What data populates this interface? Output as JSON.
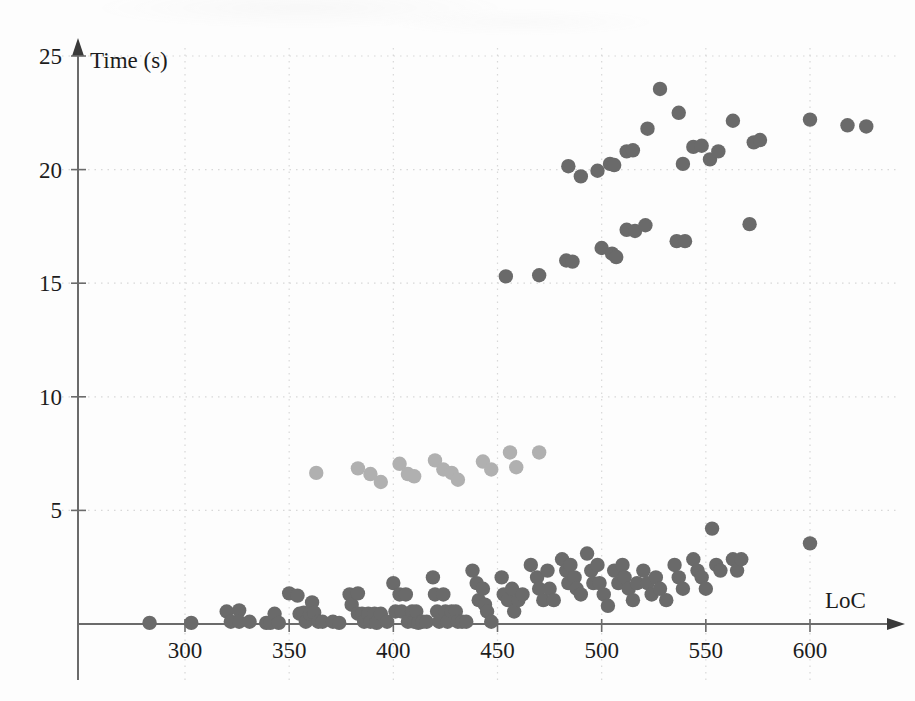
{
  "figure": {
    "background": "#fdfdfd",
    "ink": "#1c1c1c"
  },
  "axes": {
    "x_title": "LoC",
    "y_title": "Time (s)",
    "x_ticks": [
      "300",
      "350",
      "400",
      "450",
      "500",
      "550",
      "600"
    ],
    "y_ticks": [
      "5",
      "10",
      "15",
      "20",
      "25"
    ]
  },
  "chart_data": {
    "type": "scatter",
    "title": "",
    "xlabel": "LoC",
    "ylabel": "Time (s)",
    "xlim": [
      260,
      640
    ],
    "ylim": [
      0,
      25
    ],
    "xticks": [
      300,
      350,
      400,
      450,
      500,
      550,
      600
    ],
    "yticks": [
      5,
      10,
      15,
      20,
      25
    ],
    "grid": true,
    "grid_style": "dotted",
    "legend": null,
    "marker": "circle",
    "series": [
      {
        "name": "low-band",
        "color": "#6a6a6a",
        "points": [
          [
            283,
            0.05
          ],
          [
            303,
            0.05
          ],
          [
            320,
            0.55
          ],
          [
            322,
            0.1
          ],
          [
            326,
            0.6
          ],
          [
            326,
            0.1
          ],
          [
            331,
            0.1
          ],
          [
            339,
            0.05
          ],
          [
            341,
            0.05
          ],
          [
            343,
            0.45
          ],
          [
            345,
            0.05
          ],
          [
            350,
            1.35
          ],
          [
            354,
            1.25
          ],
          [
            355,
            0.45
          ],
          [
            357,
            0.5
          ],
          [
            358,
            0.1
          ],
          [
            360,
            0.45
          ],
          [
            361,
            0.95
          ],
          [
            362,
            0.5
          ],
          [
            364,
            0.1
          ],
          [
            366,
            0.1
          ],
          [
            371,
            0.1
          ],
          [
            374,
            0.05
          ],
          [
            379,
            1.3
          ],
          [
            380,
            0.85
          ],
          [
            383,
            1.35
          ],
          [
            383,
            0.45
          ],
          [
            385,
            0.45
          ],
          [
            386,
            0.1
          ],
          [
            388,
            0.45
          ],
          [
            389,
            0.1
          ],
          [
            391,
            0.45
          ],
          [
            392,
            0.05
          ],
          [
            394,
            0.45
          ],
          [
            397,
            0.1
          ],
          [
            400,
            1.8
          ],
          [
            401,
            0.55
          ],
          [
            403,
            1.3
          ],
          [
            404,
            0.55
          ],
          [
            406,
            1.3
          ],
          [
            407,
            0.1
          ],
          [
            409,
            0.55
          ],
          [
            410,
            0.1
          ],
          [
            411,
            0.55
          ],
          [
            412,
            0.05
          ],
          [
            414,
            0.1
          ],
          [
            416,
            0.1
          ],
          [
            419,
            2.05
          ],
          [
            420,
            1.3
          ],
          [
            421,
            0.55
          ],
          [
            422,
            0.1
          ],
          [
            424,
            1.3
          ],
          [
            425,
            0.55
          ],
          [
            426,
            0.1
          ],
          [
            428,
            0.55
          ],
          [
            430,
            0.55
          ],
          [
            431,
            0.1
          ],
          [
            433,
            0.1
          ],
          [
            435,
            0.1
          ],
          [
            438,
            2.35
          ],
          [
            440,
            1.8
          ],
          [
            441,
            1.05
          ],
          [
            443,
            1.55
          ],
          [
            444,
            0.85
          ],
          [
            445,
            0.55
          ],
          [
            447,
            0.1
          ],
          [
            452,
            2.05
          ],
          [
            453,
            1.3
          ],
          [
            455,
            1.05
          ],
          [
            457,
            1.55
          ],
          [
            458,
            0.55
          ],
          [
            460,
            1.05
          ],
          [
            462,
            1.3
          ],
          [
            466,
            2.6
          ],
          [
            469,
            2.05
          ],
          [
            470,
            1.55
          ],
          [
            472,
            1.05
          ],
          [
            474,
            2.35
          ],
          [
            475,
            1.55
          ],
          [
            477,
            1.05
          ],
          [
            481,
            2.85
          ],
          [
            483,
            2.35
          ],
          [
            484,
            1.8
          ],
          [
            485,
            2.6
          ],
          [
            487,
            2.05
          ],
          [
            488,
            1.55
          ],
          [
            490,
            1.3
          ],
          [
            493,
            3.1
          ],
          [
            495,
            2.35
          ],
          [
            496,
            1.8
          ],
          [
            498,
            2.6
          ],
          [
            499,
            1.8
          ],
          [
            501,
            1.3
          ],
          [
            503,
            0.8
          ],
          [
            506,
            2.35
          ],
          [
            508,
            1.8
          ],
          [
            510,
            2.6
          ],
          [
            511,
            2.05
          ],
          [
            513,
            1.55
          ],
          [
            515,
            1.05
          ],
          [
            517,
            1.8
          ],
          [
            520,
            2.35
          ],
          [
            522,
            1.8
          ],
          [
            524,
            1.3
          ],
          [
            526,
            2.05
          ],
          [
            528,
            1.55
          ],
          [
            531,
            1.05
          ],
          [
            535,
            2.6
          ],
          [
            537,
            2.05
          ],
          [
            539,
            1.55
          ],
          [
            544,
            2.85
          ],
          [
            546,
            2.35
          ],
          [
            548,
            2.05
          ],
          [
            550,
            1.55
          ],
          [
            553,
            4.2
          ],
          [
            555,
            2.6
          ],
          [
            557,
            2.35
          ],
          [
            563,
            2.85
          ],
          [
            565,
            2.35
          ],
          [
            567,
            2.85
          ],
          [
            600,
            3.55
          ]
        ]
      },
      {
        "name": "mid-band",
        "color": "#b0b0b0",
        "points": [
          [
            363,
            6.65
          ],
          [
            383,
            6.85
          ],
          [
            389,
            6.6
          ],
          [
            394,
            6.25
          ],
          [
            403,
            7.05
          ],
          [
            407,
            6.6
          ],
          [
            410,
            6.5
          ],
          [
            420,
            7.2
          ],
          [
            424,
            6.8
          ],
          [
            428,
            6.65
          ],
          [
            431,
            6.35
          ],
          [
            443,
            7.15
          ],
          [
            447,
            6.8
          ],
          [
            456,
            7.55
          ],
          [
            459,
            6.9
          ],
          [
            470,
            7.55
          ]
        ]
      },
      {
        "name": "high-band",
        "color": "#6a6a6a",
        "points": [
          [
            454,
            15.3
          ],
          [
            470,
            15.35
          ],
          [
            483,
            16.0
          ],
          [
            486,
            15.95
          ],
          [
            500,
            16.55
          ],
          [
            505,
            16.3
          ],
          [
            507,
            16.15
          ],
          [
            512,
            17.35
          ],
          [
            516,
            17.3
          ],
          [
            521,
            17.55
          ],
          [
            536,
            16.85
          ],
          [
            540,
            16.85
          ],
          [
            571,
            17.6
          ],
          [
            484,
            20.15
          ],
          [
            490,
            19.7
          ],
          [
            498,
            19.95
          ],
          [
            504,
            20.25
          ],
          [
            506,
            20.2
          ],
          [
            512,
            20.8
          ],
          [
            515,
            20.85
          ],
          [
            522,
            21.8
          ],
          [
            528,
            23.55
          ],
          [
            537,
            22.5
          ],
          [
            539,
            20.25
          ],
          [
            544,
            21.0
          ],
          [
            548,
            21.05
          ],
          [
            552,
            20.45
          ],
          [
            556,
            20.8
          ],
          [
            563,
            22.15
          ],
          [
            573,
            21.2
          ],
          [
            576,
            21.3
          ],
          [
            600,
            22.2
          ],
          [
            618,
            21.95
          ],
          [
            627,
            21.9
          ]
        ]
      }
    ]
  }
}
